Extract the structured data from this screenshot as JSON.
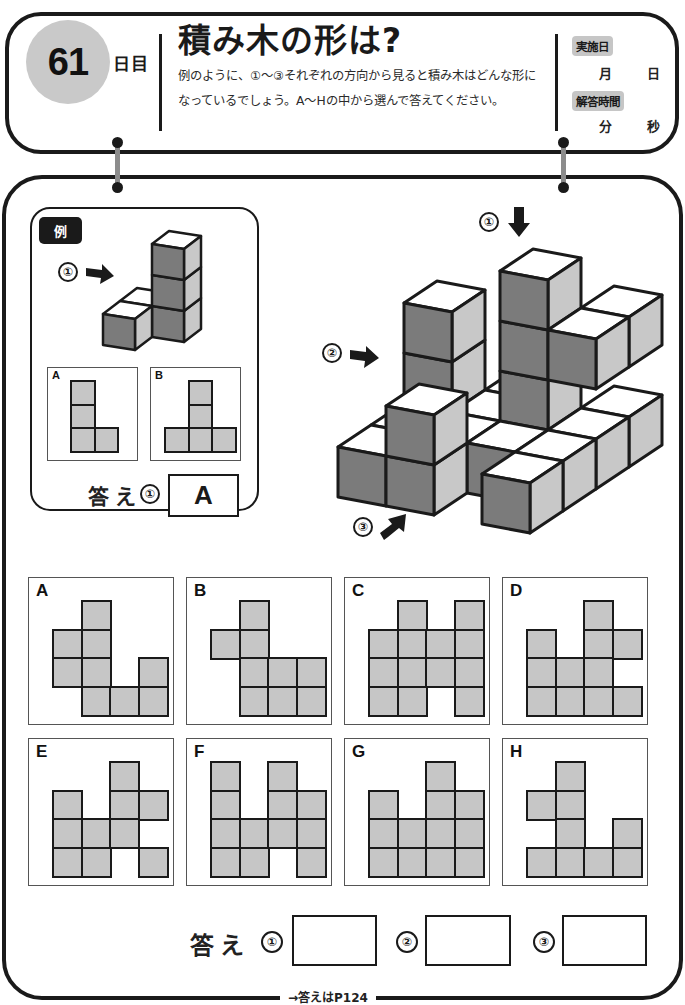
{
  "header": {
    "day_number": "61",
    "day_suffix": "日目",
    "title": "積み木の形は?",
    "instructions": [
      "例のように、①〜③それぞれの方向から見ると積み木はどんな形に",
      "なっているでしょう。A〜Hの中から選んで答えてください。"
    ],
    "record": {
      "date_label": "実施日",
      "month_unit": "月",
      "day_unit": "日",
      "time_label": "解答時間",
      "minute_unit": "分",
      "second_unit": "秒"
    }
  },
  "example": {
    "badge": "例",
    "direction_marker": "①",
    "choices": [
      {
        "label": "A",
        "cols": 3,
        "rows": 3,
        "cells": [
          [
            0,
            0
          ],
          [
            1,
            0
          ],
          [
            2,
            0
          ],
          [
            2,
            1
          ]
        ]
      },
      {
        "label": "B",
        "cols": 3,
        "rows": 3,
        "cells": [
          [
            0,
            1
          ],
          [
            1,
            1
          ],
          [
            2,
            0
          ],
          [
            2,
            1
          ],
          [
            2,
            2
          ]
        ]
      }
    ],
    "answer_label": "答え",
    "answer_marker": "①",
    "answer_value": "A"
  },
  "figure": {
    "direction_markers": [
      "①",
      "②",
      "③"
    ],
    "colors": {
      "top": "#ffffff",
      "front": "#7b7b7b",
      "side": "#c8c8c8",
      "edge": "#1a1a1a"
    }
  },
  "options": [
    {
      "label": "A",
      "cells": [
        [
          0,
          1
        ],
        [
          1,
          0
        ],
        [
          1,
          1
        ],
        [
          2,
          0
        ],
        [
          2,
          1
        ],
        [
          2,
          3
        ],
        [
          3,
          1
        ],
        [
          3,
          2
        ],
        [
          3,
          3
        ]
      ]
    },
    {
      "label": "B",
      "cells": [
        [
          0,
          1
        ],
        [
          1,
          0
        ],
        [
          1,
          1
        ],
        [
          2,
          1
        ],
        [
          2,
          2
        ],
        [
          2,
          3
        ],
        [
          3,
          1
        ],
        [
          3,
          2
        ],
        [
          3,
          3
        ]
      ]
    },
    {
      "label": "C",
      "cells": [
        [
          0,
          1
        ],
        [
          0,
          3
        ],
        [
          1,
          0
        ],
        [
          1,
          1
        ],
        [
          1,
          2
        ],
        [
          1,
          3
        ],
        [
          2,
          0
        ],
        [
          2,
          1
        ],
        [
          2,
          2
        ],
        [
          2,
          3
        ],
        [
          3,
          0
        ],
        [
          3,
          1
        ],
        [
          3,
          3
        ]
      ]
    },
    {
      "label": "D",
      "cells": [
        [
          0,
          2
        ],
        [
          1,
          0
        ],
        [
          1,
          2
        ],
        [
          1,
          3
        ],
        [
          2,
          0
        ],
        [
          2,
          1
        ],
        [
          2,
          2
        ],
        [
          3,
          0
        ],
        [
          3,
          1
        ],
        [
          3,
          2
        ],
        [
          3,
          3
        ]
      ]
    },
    {
      "label": "E",
      "cells": [
        [
          0,
          2
        ],
        [
          1,
          0
        ],
        [
          1,
          2
        ],
        [
          1,
          3
        ],
        [
          2,
          0
        ],
        [
          2,
          1
        ],
        [
          2,
          2
        ],
        [
          3,
          0
        ],
        [
          3,
          1
        ],
        [
          3,
          3
        ]
      ]
    },
    {
      "label": "F",
      "cells": [
        [
          0,
          0
        ],
        [
          0,
          2
        ],
        [
          1,
          0
        ],
        [
          1,
          2
        ],
        [
          1,
          3
        ],
        [
          2,
          0
        ],
        [
          2,
          1
        ],
        [
          2,
          2
        ],
        [
          2,
          3
        ],
        [
          3,
          0
        ],
        [
          3,
          1
        ],
        [
          3,
          3
        ]
      ]
    },
    {
      "label": "G",
      "cells": [
        [
          0,
          2
        ],
        [
          1,
          0
        ],
        [
          1,
          2
        ],
        [
          1,
          3
        ],
        [
          2,
          0
        ],
        [
          2,
          1
        ],
        [
          2,
          2
        ],
        [
          2,
          3
        ],
        [
          3,
          0
        ],
        [
          3,
          1
        ],
        [
          3,
          2
        ],
        [
          3,
          3
        ]
      ]
    },
    {
      "label": "H",
      "cells": [
        [
          0,
          1
        ],
        [
          1,
          0
        ],
        [
          1,
          1
        ],
        [
          2,
          1
        ],
        [
          2,
          3
        ],
        [
          3,
          0
        ],
        [
          3,
          1
        ],
        [
          3,
          2
        ],
        [
          3,
          3
        ]
      ]
    }
  ],
  "answers": {
    "label": "答え",
    "slots": [
      {
        "marker": "①",
        "value": ""
      },
      {
        "marker": "②",
        "value": ""
      },
      {
        "marker": "③",
        "value": ""
      }
    ]
  },
  "footer": {
    "answer_ref": "→答えはP124"
  }
}
